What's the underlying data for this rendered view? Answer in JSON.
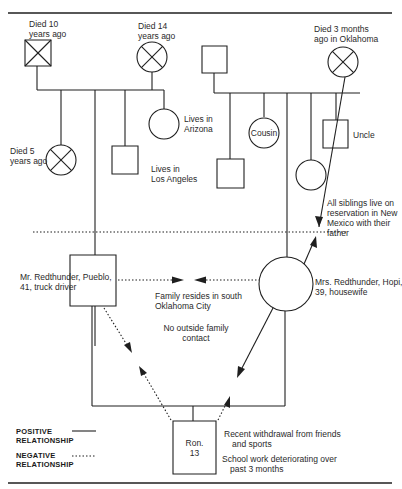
{
  "diagram": {
    "type": "genogram",
    "paternal_side": {
      "grandfather": {
        "symbol": "square-deceased",
        "label_line1": "Died 10",
        "label_line2": "years ago"
      },
      "grandmother": {
        "symbol": "circle-deceased",
        "label_line1": "Died 14",
        "label_line2": "years ago"
      },
      "children": [
        {
          "symbol": "circle-deceased",
          "label_line1": "Died 5",
          "label_line2": "years ago"
        },
        {
          "symbol": "square",
          "label_line1": "Mr. Redthunder, Pueblo,",
          "label_line2": "41, truck driver"
        },
        {
          "symbol": "square",
          "label_line1": "Lives in",
          "label_line2": "Los Angeles"
        },
        {
          "symbol": "circle",
          "label_line1": "Lives in",
          "label_line2": "Arizona"
        }
      ]
    },
    "maternal_side": {
      "grandfather": {
        "symbol": "square"
      },
      "grandmother": {
        "symbol": "circle-deceased",
        "label_line1": "Died 3 months",
        "label_line2": "ago in Oklahoma"
      },
      "children": [
        {
          "symbol": "square"
        },
        {
          "symbol": "circle",
          "label": "Cousin"
        },
        {
          "symbol": "circle",
          "label_line1": "Mrs. Redthunder, Hopi,",
          "label_line2": "39, housewife"
        },
        {
          "symbol": "circle"
        },
        {
          "symbol": "square",
          "label": "Uncle"
        }
      ],
      "note_line1": "All siblings live on",
      "note_line2": "reservation in New",
      "note_line3": "Mexico with their",
      "note_line4": "father"
    },
    "household": {
      "residence_line1": "Family resides in south",
      "residence_line2": "Oklahoma City",
      "contact_line1": "No outside family",
      "contact_line2": "contact",
      "child": {
        "symbol": "square",
        "name": "Ron.",
        "age": "13"
      },
      "child_note1_line1": "Recent withdrawal from friends",
      "child_note1_line2": "and sports",
      "child_note2_line1": "School work deteriorating over",
      "child_note2_line2": "past 3 months"
    },
    "legend": {
      "positive_line1": "POSITIVE",
      "positive_line2": "RELATIONSHIP",
      "negative_line1": "NEGATIVE",
      "negative_line2": "RELATIONSHIP"
    },
    "colors": {
      "ink": "#1f1f1f",
      "background": "#ffffff"
    }
  }
}
